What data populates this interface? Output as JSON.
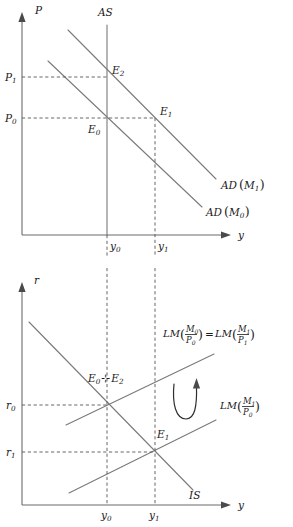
{
  "figure": {
    "colors": {
      "axis": "#6b6b6b",
      "curve": "#7a7a7a",
      "guide": "#555555",
      "text": "#1a1a1a",
      "background": "#ffffff"
    }
  },
  "top_panel": {
    "name": "ad-as-diagram",
    "y_axis_label": "P",
    "x_axis_label": "y",
    "y_ticks": [
      {
        "base": "P",
        "sub": "1"
      },
      {
        "base": "P",
        "sub": "0"
      }
    ],
    "x_ticks": [
      {
        "base": "y",
        "sub": "0"
      },
      {
        "base": "y",
        "sub": "1"
      }
    ],
    "curves": [
      {
        "name": "AS",
        "label": "AS",
        "type": "vertical-supply"
      },
      {
        "name": "AD-M1",
        "label_base": "AD",
        "label_arg": "M",
        "label_sub": "1"
      },
      {
        "name": "AD-M0",
        "label_base": "AD",
        "label_arg": "M",
        "label_sub": "0"
      }
    ],
    "equilibria": [
      {
        "base": "E",
        "sub": "2"
      },
      {
        "base": "E",
        "sub": "1"
      },
      {
        "base": "E",
        "sub": "0"
      }
    ]
  },
  "bottom_panel": {
    "name": "is-lm-diagram",
    "y_axis_label": "r",
    "x_axis_label": "y",
    "y_ticks": [
      {
        "base": "r",
        "sub": "0"
      },
      {
        "base": "r",
        "sub": "1"
      }
    ],
    "x_ticks": [
      {
        "base": "y",
        "sub": "0"
      },
      {
        "base": "y",
        "sub": "1"
      }
    ],
    "curves": [
      {
        "name": "LM-initial-equals-final",
        "kind": "lm",
        "left_base": "LM",
        "left_num": "M",
        "left_num_sub": "0",
        "left_den": "P",
        "left_den_sub": "0",
        "equals": "=",
        "right_base": "LM",
        "right_num": "M",
        "right_num_sub": "1",
        "right_den": "P",
        "right_den_sub": "1"
      },
      {
        "name": "LM-shifted",
        "kind": "lm",
        "left_base": "LM",
        "left_num": "M",
        "left_num_sub": "1",
        "left_den": "P",
        "left_den_sub": "0"
      },
      {
        "name": "IS",
        "kind": "is",
        "label": "IS"
      }
    ],
    "equilibria": [
      {
        "base": "E",
        "sub": "0"
      },
      {
        "base": "E",
        "sub": "2"
      },
      {
        "base": "E",
        "sub": "1"
      }
    ],
    "equilibrium_joiner": "⊹",
    "annotation": {
      "name": "rotation-arrow",
      "symbol": "curved-up-arrow"
    }
  }
}
